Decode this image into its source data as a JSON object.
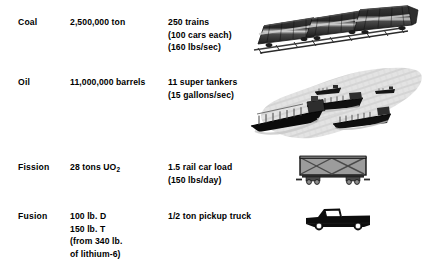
{
  "figure": {
    "rows": [
      {
        "source": "Coal",
        "amount_lines": [
          "2,500,000 ton"
        ],
        "equivalent_lines": [
          "250 trains",
          "(100 cars each)",
          "(160 lbs/sec)"
        ],
        "illustration": "coal-trains-illustration"
      },
      {
        "source": "Oil",
        "amount_lines": [
          "11,000,000 barrels"
        ],
        "equivalent_lines": [
          "11 super tankers",
          "(15 gallons/sec)"
        ],
        "illustration": "oil-supertankers-illustration"
      },
      {
        "source": "Fission",
        "amount_lines": [
          "28 tons UO",
          "2"
        ],
        "amount_display": "28 tons UO2",
        "equivalent_lines": [
          "1.5 rail car load",
          "(150 lbs/day)"
        ],
        "illustration": "fission-rail-car-illustration"
      },
      {
        "source": "Fusion",
        "amount_lines": [
          "100 lb. D",
          "150 lb. T",
          "(from 340 lb.",
          "of lithium-6)"
        ],
        "equivalent_lines": [
          "1/2 ton pickup truck"
        ],
        "illustration": "fusion-pickup-truck-illustration"
      }
    ],
    "text": {
      "coal_label": "Coal",
      "coal_amount": "2,500,000 ton",
      "coal_equiv_1": "250 trains",
      "coal_equiv_2": "(100 cars each)",
      "coal_equiv_3": "(160 lbs/sec)",
      "oil_label": "Oil",
      "oil_amount": "11,000,000 barrels",
      "oil_equiv_1": "11 super tankers",
      "oil_equiv_2": "(15 gallons/sec)",
      "fission_label": "Fission",
      "fission_amount_main": "28 tons UO",
      "fission_amount_sub": "2",
      "fission_equiv_1": "1.5 rail car load",
      "fission_equiv_2": "(150 lbs/day)",
      "fusion_label": "Fusion",
      "fusion_amount_1": "100 lb. D",
      "fusion_amount_2": "150 lb. T",
      "fusion_amount_3": "(from 340 lb.",
      "fusion_amount_4": "of lithium-6)",
      "fusion_equiv_1": "1/2 ton pickup truck"
    },
    "colors": {
      "background": "#ffffff",
      "text": "#000000",
      "train_dark": "#2b2b2b",
      "train_stripe": "#d8d8d8",
      "water_gray": "#d9d9d9",
      "ship_hull": "#1a1a1a",
      "railcar_body": "#9a9a9a",
      "railcar_outline": "#1a1a1a",
      "truck_body": "#0d0d0d",
      "wheel_white": "#ffffff"
    }
  }
}
